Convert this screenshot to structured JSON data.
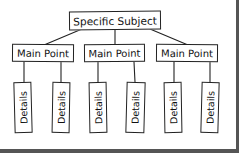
{
  "diagram": {
    "root": {
      "label": "Specific Subject"
    },
    "main_points": [
      {
        "label": "Main Point",
        "details": [
          "Details",
          "Details"
        ]
      },
      {
        "label": "Main Point",
        "details": [
          "Details",
          "Details"
        ]
      },
      {
        "label": "Main Point",
        "details": [
          "Details",
          "Details"
        ]
      }
    ]
  },
  "colors": {
    "stroke": "#222222",
    "background": "#ffffff",
    "frame_border": "#555555"
  }
}
